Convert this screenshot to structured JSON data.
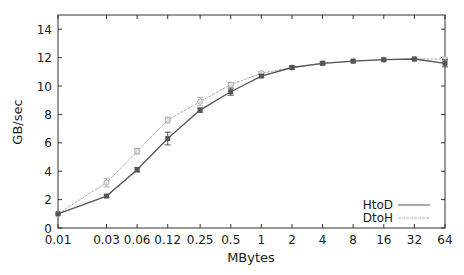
{
  "chart_data": {
    "type": "line",
    "title": "",
    "xlabel": "MBytes",
    "ylabel": "GB/sec",
    "x_scale": "log2",
    "categories": [
      "0.01",
      "0.03",
      "0.06",
      "0.12",
      "0.25",
      "0.5",
      "1",
      "2",
      "4",
      "8",
      "16",
      "32",
      "64"
    ],
    "x": [
      0.01,
      0.03,
      0.06,
      0.12,
      0.25,
      0.5,
      1,
      2,
      4,
      8,
      16,
      32,
      64
    ],
    "series": [
      {
        "name": "HtoD",
        "color": "#555555",
        "marker": "filled-square",
        "values": [
          1.0,
          2.25,
          4.1,
          6.3,
          8.3,
          9.6,
          10.7,
          11.3,
          11.6,
          11.75,
          11.85,
          11.9,
          11.6
        ],
        "error": [
          0.05,
          0.1,
          0.15,
          0.45,
          0.15,
          0.25,
          0.1,
          0.1,
          0.1,
          0.05,
          0.05,
          0.05,
          0.25
        ]
      },
      {
        "name": "DtoH",
        "color": "#b0b0b0",
        "marker": "open-circle",
        "values": [
          1.0,
          3.2,
          5.4,
          7.6,
          8.9,
          10.1,
          10.9,
          11.3,
          11.6,
          11.75,
          11.85,
          11.9,
          11.9
        ],
        "error": [
          0.05,
          0.3,
          0.2,
          0.2,
          0.3,
          0.15,
          0.1,
          0.1,
          0.05,
          0.05,
          0.05,
          0.05,
          0.1
        ]
      }
    ],
    "yticks": [
      0,
      2,
      4,
      6,
      8,
      10,
      12,
      14
    ],
    "ylim": [
      0,
      15
    ],
    "xlim": [
      0.01,
      64
    ],
    "grid": false,
    "legend_position": "lower right"
  },
  "axes": {
    "xlabel": "MBytes",
    "ylabel": "GB/sec",
    "xtick_labels": [
      "0.01",
      "0.03",
      "0.06",
      "0.12",
      "0.25",
      "0.5",
      "1",
      "2",
      "4",
      "8",
      "16",
      "32",
      "64"
    ],
    "ytick_labels": [
      "0",
      "2",
      "4",
      "6",
      "8",
      "10",
      "12",
      "14"
    ]
  },
  "legend": {
    "items": [
      {
        "label": "HtoD",
        "color": "#555555"
      },
      {
        "label": "DtoH",
        "color": "#b0b0b0"
      }
    ]
  }
}
